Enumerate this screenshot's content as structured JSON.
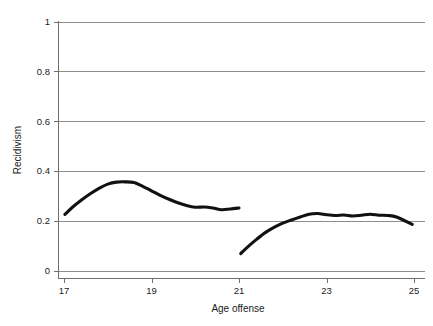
{
  "chart_data": {
    "type": "line",
    "title": "",
    "xlabel": "Age offense",
    "ylabel": "Recidivism",
    "xlim": [
      17,
      25
    ],
    "ylim": [
      0,
      1
    ],
    "grid": true,
    "legend": "none",
    "xticks": [
      "17",
      "19",
      "21",
      "23",
      "25"
    ],
    "xtick_values": [
      17,
      19,
      21,
      23,
      25
    ],
    "yticks": [
      "0",
      "0.2",
      "0.4",
      "0.6",
      "0.8",
      "1"
    ],
    "ytick_values": [
      0,
      0.2,
      0.4,
      0.6,
      0.8,
      1
    ],
    "series": [
      {
        "name": "below-threshold",
        "x": [
          17.02,
          17.2,
          17.4,
          17.6,
          17.8,
          18.0,
          18.2,
          18.4,
          18.6,
          18.8,
          19.0,
          19.2,
          19.4,
          19.6,
          19.8,
          20.0,
          20.2,
          20.4,
          20.6,
          20.8,
          21.0
        ],
        "values": [
          0.225,
          0.255,
          0.283,
          0.308,
          0.33,
          0.347,
          0.355,
          0.356,
          0.353,
          0.338,
          0.32,
          0.302,
          0.286,
          0.272,
          0.261,
          0.254,
          0.255,
          0.251,
          0.244,
          0.247,
          0.251
        ]
      },
      {
        "name": "above-threshold",
        "x": [
          21.04,
          21.2,
          21.4,
          21.6,
          21.8,
          22.0,
          22.2,
          22.4,
          22.6,
          22.8,
          23.0,
          23.2,
          23.4,
          23.6,
          23.8,
          24.0,
          24.2,
          24.4,
          24.6,
          24.96
        ],
        "values": [
          0.068,
          0.095,
          0.125,
          0.152,
          0.173,
          0.19,
          0.203,
          0.215,
          0.226,
          0.229,
          0.224,
          0.221,
          0.223,
          0.219,
          0.222,
          0.226,
          0.222,
          0.221,
          0.215,
          0.185
        ]
      }
    ]
  },
  "colors": {
    "line": "#111111",
    "grid": "#8d8d8d",
    "axis": "#6e6e6e",
    "background": "#ffffff",
    "text": "#1b1b1b"
  }
}
